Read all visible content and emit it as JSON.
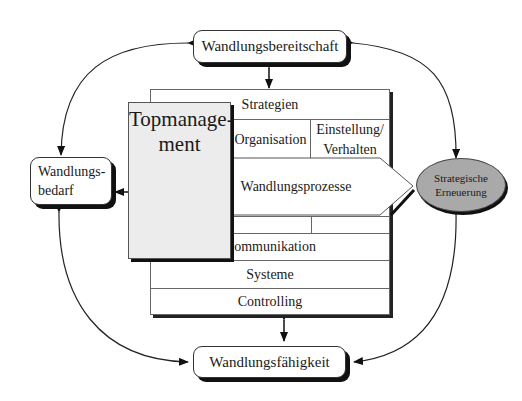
{
  "diagram": {
    "nodes": {
      "readiness": {
        "label": "Wandlungsbereitschaft"
      },
      "need": {
        "label_line1": "Wandlungs-",
        "label_line2": "bedarf"
      },
      "capability": {
        "label": "Wandlungsfähigkeit"
      },
      "renewal": {
        "label_line1": "Strategische",
        "label_line2": "Erneuerung",
        "fill": "#a9a9a9"
      },
      "topmanagement": {
        "label_line1": "Topmanage-",
        "label_line2": "ment",
        "fill": "#ececec"
      }
    },
    "central_block": {
      "rows": {
        "strategies": "Strategien",
        "organisation": "Organisation",
        "attitude_line1": "Einstellung/",
        "attitude_line2": "Verhalten",
        "processes": "Wandlungsprozesse",
        "communication": "Kommunikation",
        "systems": "Systeme",
        "controlling": "Controlling"
      }
    },
    "connections": [
      {
        "from": "readiness",
        "to": "central_block",
        "type": "bidirectional"
      },
      {
        "from": "capability",
        "to": "central_block",
        "type": "bidirectional"
      },
      {
        "from": "readiness",
        "to": "need",
        "type": "bidirectional-curved"
      },
      {
        "from": "readiness",
        "to": "renewal",
        "type": "bidirectional-curved"
      },
      {
        "from": "need",
        "to": "capability",
        "type": "bidirectional-curved"
      },
      {
        "from": "renewal",
        "to": "capability",
        "type": "bidirectional-curved"
      },
      {
        "from": "topmanagement",
        "to": "need",
        "type": "arrow"
      },
      {
        "from": "processes",
        "to": "renewal",
        "type": "arrow"
      }
    ]
  }
}
